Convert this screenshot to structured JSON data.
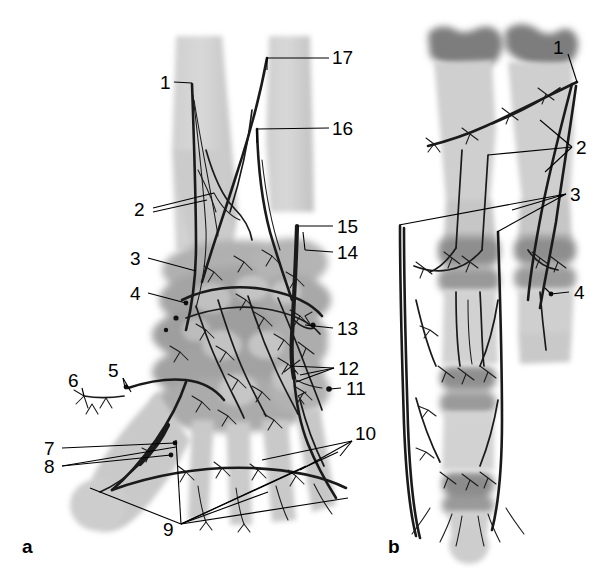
{
  "figure": {
    "type": "anatomical-illustration",
    "background_color": "#ffffff",
    "ink_color": "#1a1a1a",
    "panels": [
      {
        "id": "a",
        "label": "a",
        "caption": "a",
        "view": "Dorsal view of wrist, carpus and metacarpus with arterial network",
        "label_position": {
          "x": 22,
          "y": 548
        }
      },
      {
        "id": "b",
        "label": "b",
        "caption": "b",
        "view": "Finger with phalanges, joints and digital arteries",
        "label_position": {
          "x": 389,
          "y": 548
        }
      }
    ],
    "bone_tones": {
      "light_bone": "#d2d2d2",
      "mid_bone": "#bdbdbd",
      "shadow_bone": "#a6a6a6",
      "dark_cartilage": "#8c8c8c",
      "darkest_epiphysis": "#7d7d7d"
    },
    "callouts": [
      {
        "number": "1",
        "panel": "a",
        "x": 160,
        "y": 82,
        "anchor_x": 192,
        "anchor_y": 83
      },
      {
        "number": "2",
        "panel": "a",
        "x": 137,
        "y": 213,
        "anchor_x": 214,
        "anchor_y": 193
      },
      {
        "number": "3",
        "panel": "a",
        "x": 131,
        "y": 262,
        "anchor_x": 196,
        "anchor_y": 271
      },
      {
        "number": "4",
        "panel": "a",
        "x": 132,
        "y": 297,
        "anchor_x": 186,
        "anchor_y": 304
      },
      {
        "number": "5",
        "panel": "a",
        "x": 110,
        "y": 371,
        "anchor_x": 125,
        "anchor_y": 388
      },
      {
        "number": "6",
        "panel": "a",
        "x": 72,
        "y": 382,
        "anchor_x": 84,
        "anchor_y": 396
      },
      {
        "number": "7",
        "panel": "a",
        "x": 44,
        "y": 452,
        "anchor_x": 175,
        "anchor_y": 444
      },
      {
        "number": "8",
        "panel": "a",
        "x": 44,
        "y": 471,
        "anchor_x": 170,
        "anchor_y": 456
      },
      {
        "number": "9",
        "panel": "a",
        "x": 165,
        "y": 530,
        "anchor_x": 178,
        "anchor_y": 525
      },
      {
        "number": "10",
        "panel": "a",
        "x": 356,
        "y": 434,
        "anchor_x": 340,
        "anchor_y": 456
      },
      {
        "number": "11",
        "panel": "a",
        "x": 345,
        "y": 391,
        "anchor_x": 330,
        "anchor_y": 389
      },
      {
        "number": "12",
        "panel": "a",
        "x": 338,
        "y": 371,
        "anchor_x": 300,
        "anchor_y": 375
      },
      {
        "number": "13",
        "panel": "a",
        "x": 337,
        "y": 331,
        "anchor_x": 300,
        "anchor_y": 325
      },
      {
        "number": "14",
        "panel": "a",
        "x": 337,
        "y": 255,
        "anchor_x": 305,
        "anchor_y": 252
      },
      {
        "number": "15",
        "panel": "a",
        "x": 337,
        "y": 228,
        "anchor_x": 298,
        "anchor_y": 228
      },
      {
        "number": "16",
        "panel": "a",
        "x": 333,
        "y": 128,
        "anchor_x": 257,
        "anchor_y": 129
      },
      {
        "number": "17",
        "panel": "a",
        "x": 333,
        "y": 57,
        "anchor_x": 267,
        "anchor_y": 58
      },
      {
        "number": "1",
        "panel": "b",
        "x": 556,
        "y": 47,
        "anchor_x": 577,
        "anchor_y": 82
      },
      {
        "number": "2",
        "panel": "b",
        "x": 577,
        "y": 150,
        "anchor_x": 488,
        "anchor_y": 155
      },
      {
        "number": "3",
        "panel": "b",
        "x": 569,
        "y": 197,
        "anchor_x": 399,
        "anchor_y": 225
      },
      {
        "number": "4",
        "panel": "b",
        "x": 573,
        "y": 292,
        "anchor_x": 551,
        "anchor_y": 294
      }
    ],
    "legend_numbers": [
      "1",
      "2",
      "3",
      "4",
      "5",
      "6",
      "7",
      "8",
      "9",
      "10",
      "11",
      "12",
      "13",
      "14",
      "15",
      "16",
      "17"
    ]
  }
}
